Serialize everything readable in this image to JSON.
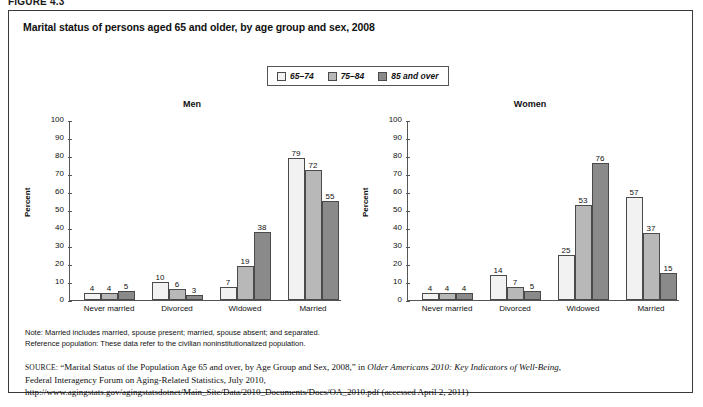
{
  "figure_label": "FIGURE 4.3",
  "chart_title": "Marital status of persons aged 65 and older, by age group and sex, 2008",
  "legend": {
    "items": [
      {
        "label": "65–74",
        "color": "#f2f2f2"
      },
      {
        "label": "75–84",
        "color": "#b8b8b8"
      },
      {
        "label": "85 and over",
        "color": "#8a8a8a"
      }
    ]
  },
  "notes": {
    "line1": "Note: Married includes married, spouse present; married, spouse absent; and separated.",
    "line2": "Reference population: These data refer to the civilian noninstitutionalized population."
  },
  "source": {
    "kicker": "SOURCE:",
    "part1": " “Marital Status of the Population Age 65 and over, by Age Group and Sex, 2008,” in ",
    "italic1": "Older Americans 2010: Key Indicators of Well-Being",
    "part2": ", Federal Interagency Forum on Aging-Related Statistics, July 2010, http://www.agingstats.gov/agingstatsdotnet/Main_Site/Data/2010_Documents/Docs/OA_2010.pdf (accessed April 2, 2011)"
  },
  "chart_data": {
    "type": "bar",
    "title": "Marital status of persons aged 65 and older, by age group and sex, 2008",
    "xlabel": "",
    "ylabel": "Percent",
    "ylim": [
      0,
      100
    ],
    "ytick_labels": [
      "0",
      "10",
      "20",
      "30",
      "40",
      "50",
      "60",
      "70",
      "80",
      "90",
      "100"
    ],
    "grid": false,
    "legend_position": "top-center",
    "categories": [
      "Never married",
      "Divorced",
      "Widowed",
      "Married"
    ],
    "panels": [
      {
        "name": "Men",
        "series": [
          {
            "name": "65–74",
            "color": "#f2f2f2",
            "values": [
              4,
              10,
              7,
              79
            ]
          },
          {
            "name": "75–84",
            "color": "#b8b8b8",
            "values": [
              4,
              6,
              19,
              72
            ]
          },
          {
            "name": "85 and over",
            "color": "#8a8a8a",
            "values": [
              5,
              3,
              38,
              55
            ]
          }
        ]
      },
      {
        "name": "Women",
        "series": [
          {
            "name": "65–74",
            "color": "#f2f2f2",
            "values": [
              4,
              14,
              25,
              57
            ]
          },
          {
            "name": "75–84",
            "color": "#b8b8b8",
            "values": [
              4,
              7,
              53,
              37
            ]
          },
          {
            "name": "85 and over",
            "color": "#8a8a8a",
            "values": [
              4,
              5,
              76,
              15
            ]
          }
        ]
      }
    ]
  }
}
